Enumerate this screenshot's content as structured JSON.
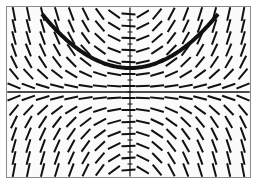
{
  "chart_data": {
    "type": "slope_field",
    "title": "",
    "xlabel": "",
    "ylabel": "",
    "grid": false,
    "axes": {
      "x_axis_y_px": 92,
      "y_axis_x_px": 130
    },
    "frame": {
      "x": 6,
      "y": 6,
      "width": 245,
      "height": 172
    },
    "field": {
      "columns": 17,
      "rows": 14,
      "description": "Slope field symmetric about the y-axis; slopes are horizontal along a band near the x-axis, steepen away from the center; above the band segments slope away from center (upward outward), below the band they slope downward outward."
    },
    "solution_curve": {
      "shape": "U-shaped (parabola-like)",
      "vertex_px": [
        130,
        68
      ],
      "left_end_px": [
        42,
        14
      ],
      "right_end_px": [
        218,
        14
      ],
      "stroke_px": 4
    },
    "colors": {
      "ink": "#111111",
      "frame": "#8a8a8a",
      "background": "#fbfbfb"
    }
  }
}
